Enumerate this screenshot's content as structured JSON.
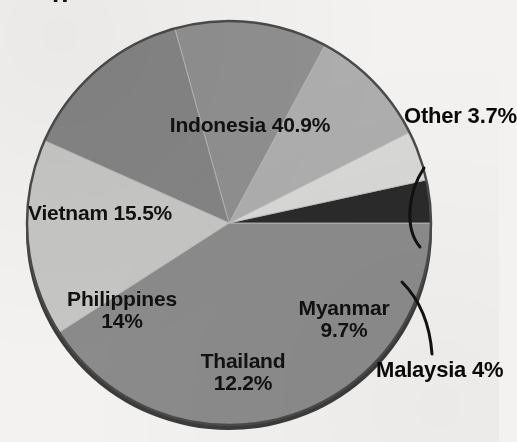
{
  "title_fragment": "p",
  "background_color": "#f3f2f0",
  "chart_data": {
    "type": "pie",
    "title": "",
    "subtitle": "",
    "xlabel": "",
    "ylabel": "",
    "legend_position": "none",
    "grid": false,
    "labels_inside": true,
    "categories": [
      "Indonesia",
      "Other",
      "Malaysia",
      "Myanmar",
      "Thailand",
      "Philippines",
      "Vietnam"
    ],
    "values": [
      40.9,
      3.7,
      4.0,
      9.7,
      12.2,
      14.0,
      15.5
    ],
    "value_unit": "%",
    "total": 100.0,
    "slices": [
      {
        "name": "Indonesia",
        "value": 40.9,
        "value_text": "40.9%",
        "label_line1": "Indonesia 40.9%",
        "label_line2": "",
        "color": "#8b8b8b",
        "label_placement": "inside",
        "start_angle_deg": 0.0,
        "end_angle_deg": 147.24
      },
      {
        "name": "Other",
        "value": 3.7,
        "value_text": "3.7%",
        "label_line1": "Other",
        "label_line2": "3.7%",
        "color": "#2a2a2a",
        "label_placement": "outside",
        "start_angle_deg": 347.68,
        "end_angle_deg": 360.0
      },
      {
        "name": "Malaysia",
        "value": 4.0,
        "value_text": "4%",
        "label_line1": "Malaysia",
        "label_line2": "4%",
        "color": "#d8d8d6",
        "label_placement": "outside",
        "start_angle_deg": 333.28,
        "end_angle_deg": 347.68
      },
      {
        "name": "Myanmar",
        "value": 9.7,
        "value_text": "9.7%",
        "label_line1": "Myanmar",
        "label_line2": "9.7%",
        "color": "#aeaeae",
        "label_placement": "inside",
        "start_angle_deg": 298.36,
        "end_angle_deg": 333.28
      },
      {
        "name": "Thailand",
        "value": 12.2,
        "value_text": "12.2%",
        "label_line1": "Thailand",
        "label_line2": "12.2%",
        "color": "#8f8f8f",
        "label_placement": "inside",
        "start_angle_deg": 254.44,
        "end_angle_deg": 298.36
      },
      {
        "name": "Philippines",
        "value": 14.0,
        "value_text": "14%",
        "label_line1": "Philippines",
        "label_line2": "14%",
        "color": "#848484",
        "label_placement": "inside",
        "start_angle_deg": 204.04,
        "end_angle_deg": 254.44
      },
      {
        "name": "Vietnam",
        "value": 15.5,
        "value_text": "15.5%",
        "label_line1": "Vietnam 15.5%",
        "label_line2": "",
        "color": "#c6c6c4",
        "label_placement": "inside",
        "start_angle_deg": 147.24,
        "end_angle_deg": 204.04
      }
    ]
  },
  "geometry": {
    "center_x": 229,
    "center_y": 223,
    "radius": 202,
    "rim_color": "#3b3b3b",
    "outline_color": "#3f3f3f"
  },
  "callouts": [
    {
      "name": "other-leader-line",
      "target": "Other"
    },
    {
      "name": "malaysia-leader-line",
      "target": "Malaysia"
    }
  ]
}
